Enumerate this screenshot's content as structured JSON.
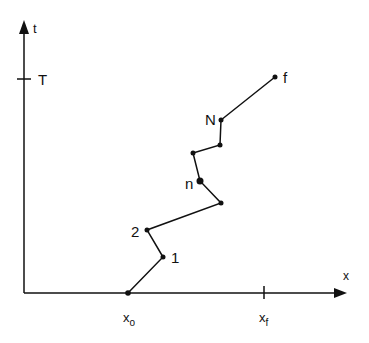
{
  "axes": {
    "y_label": "t",
    "x_label": "x",
    "y_tick_label": "T",
    "x_tick_labels": [
      "x",
      "x"
    ],
    "x_tick_subscripts": [
      "o",
      "f"
    ]
  },
  "path_labels": {
    "start_point_1": "1",
    "point_2": "2",
    "point_n": "n",
    "point_N": "N",
    "end_point": "f"
  },
  "path_points": [
    [
      128,
      293
    ],
    [
      163,
      257
    ],
    [
      147,
      230
    ],
    [
      221,
      203
    ],
    [
      200,
      181
    ],
    [
      193,
      153
    ],
    [
      220,
      145
    ],
    [
      221,
      120
    ],
    [
      275,
      77
    ]
  ]
}
